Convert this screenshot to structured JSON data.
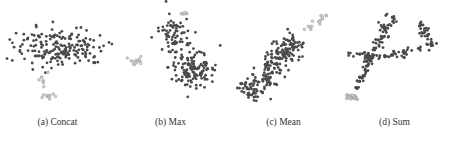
{
  "figure": {
    "captions": [
      "(a) Concat",
      "(b) Max",
      "(c) Mean",
      "(d) Sum"
    ]
  },
  "colors": {
    "main": "#4a4a4a",
    "minor_fill": "#d8d8d8",
    "minor_stroke": "#8a8a8a"
  },
  "chart_data": [
    {
      "type": "scatter",
      "title": "(a) Concat",
      "xlabel": "",
      "ylabel": "",
      "grid": false,
      "description": "Large dark cluster spread horizontally at top; small light cluster below-left",
      "clusters": [
        {
          "name": "main",
          "n": 190,
          "shape": "ellipse",
          "cx": 60,
          "cy": 48,
          "rx": 42,
          "ry": 18,
          "style": "dark"
        },
        {
          "name": "minor1",
          "n": 8,
          "shape": "ellipse",
          "cx": 42,
          "cy": 79,
          "rx": 4,
          "ry": 6,
          "style": "light"
        },
        {
          "name": "minor2",
          "n": 10,
          "shape": "ellipse",
          "cx": 50,
          "cy": 96,
          "rx": 8,
          "ry": 2.5,
          "style": "light"
        }
      ]
    },
    {
      "type": "scatter",
      "title": "(b) Max",
      "xlabel": "",
      "ylabel": "",
      "grid": false,
      "description": "Dark cloud spanning top-left to bottom-right; light cluster on left and small light group at top",
      "clusters": [
        {
          "name": "main-upper",
          "n": 70,
          "shape": "ellipse",
          "cx": 61,
          "cy": 35,
          "rx": 14,
          "ry": 18,
          "style": "dark"
        },
        {
          "name": "main-lower",
          "n": 130,
          "shape": "ellipse",
          "cx": 80,
          "cy": 68,
          "rx": 22,
          "ry": 16,
          "style": "dark"
        },
        {
          "name": "minor-left",
          "n": 12,
          "shape": "ellipse",
          "cx": 23,
          "cy": 60,
          "rx": 6,
          "ry": 4,
          "style": "light"
        },
        {
          "name": "minor-top",
          "n": 6,
          "shape": "ellipse",
          "cx": 71,
          "cy": 14,
          "rx": 5,
          "ry": 1.5,
          "style": "light"
        }
      ]
    },
    {
      "type": "scatter",
      "title": "(c) Mean",
      "xlabel": "",
      "ylabel": "",
      "grid": false,
      "description": "Dark diagonal band from bottom-left to upper-right; light cluster at upper right end",
      "clusters": [
        {
          "name": "main",
          "n": 230,
          "shape": "diagonal",
          "x0": 20,
          "y0": 96,
          "x1": 72,
          "y1": 38,
          "width": 13,
          "style": "dark"
        },
        {
          "name": "minor",
          "n": 16,
          "shape": "diagonal",
          "x0": 78,
          "y0": 32,
          "x1": 100,
          "y1": 14,
          "width": 3,
          "style": "light"
        }
      ]
    },
    {
      "type": "scatter",
      "title": "(d) Sum",
      "xlabel": "",
      "ylabel": "",
      "grid": false,
      "description": "Dark branched tree shape with several arms; dense light cluster at bottom-left tip",
      "clusters": [
        {
          "name": "trunk",
          "n": 50,
          "shape": "diagonal",
          "x0": 20,
          "y0": 92,
          "x1": 35,
          "y1": 55,
          "width": 5,
          "style": "dark"
        },
        {
          "name": "arm-up",
          "n": 55,
          "shape": "diagonal",
          "x0": 35,
          "y0": 55,
          "x1": 58,
          "y1": 16,
          "width": 7,
          "style": "dark"
        },
        {
          "name": "arm-mid",
          "n": 35,
          "shape": "diagonal",
          "x0": 36,
          "y0": 58,
          "x1": 86,
          "y1": 50,
          "width": 4,
          "style": "dark"
        },
        {
          "name": "arm-right",
          "n": 35,
          "shape": "diagonal",
          "x0": 84,
          "y0": 20,
          "x1": 96,
          "y1": 50,
          "width": 5,
          "style": "dark"
        },
        {
          "name": "arm-left",
          "n": 20,
          "shape": "diagonal",
          "x0": 12,
          "y0": 55,
          "x1": 38,
          "y1": 55,
          "width": 4,
          "style": "dark"
        },
        {
          "name": "minor",
          "n": 30,
          "shape": "ellipse",
          "cx": 16,
          "cy": 96,
          "rx": 5,
          "ry": 4,
          "style": "light"
        }
      ]
    }
  ]
}
